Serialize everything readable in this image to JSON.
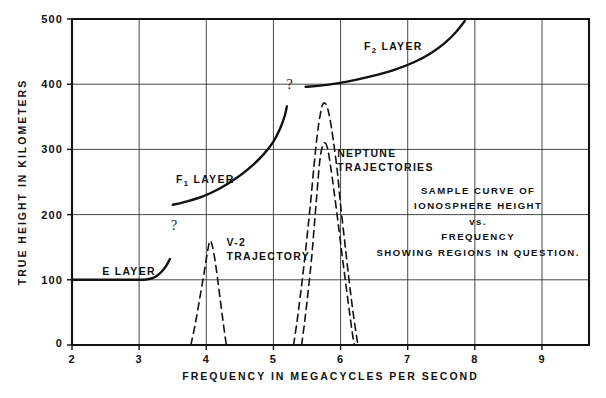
{
  "chart_data": {
    "type": "line",
    "title": "",
    "xlabel": "FREQUENCY IN MEGACYCLES PER SECOND",
    "ylabel": "TRUE HEIGHT IN KILOMETERS",
    "xlim": [
      2,
      9.7
    ],
    "ylim": [
      0,
      500
    ],
    "xticks": [
      2,
      3,
      4,
      5,
      6,
      7,
      8,
      9
    ],
    "xtick_labels": [
      "2",
      "3",
      "4",
      "5",
      "6",
      "7",
      "8",
      "9"
    ],
    "yticks": [
      0,
      100,
      200,
      300,
      400,
      500
    ],
    "ytick_labels": [
      "0",
      "100",
      "200",
      "300",
      "400",
      "500"
    ],
    "grid": true,
    "legend_position": "inline-annotations",
    "series": [
      {
        "name": "E LAYER",
        "style": "solid",
        "label": "E LAYER",
        "label_x": 2.45,
        "label_y": 108,
        "points": [
          [
            2.02,
            100
          ],
          [
            2.4,
            100
          ],
          [
            2.8,
            100
          ],
          [
            3.0,
            100
          ],
          [
            3.1,
            100.5
          ],
          [
            3.18,
            102
          ],
          [
            3.26,
            106
          ],
          [
            3.33,
            112
          ],
          [
            3.4,
            121
          ],
          [
            3.46,
            132
          ]
        ]
      },
      {
        "name": "F1 LAYER",
        "style": "solid",
        "label": "F",
        "label_sub": "1",
        "label_suffix": " LAYER",
        "label_x": 3.55,
        "label_y": 248,
        "points": [
          [
            3.5,
            215
          ],
          [
            3.7,
            220
          ],
          [
            3.95,
            228
          ],
          [
            4.2,
            240
          ],
          [
            4.45,
            256
          ],
          [
            4.65,
            272
          ],
          [
            4.85,
            292
          ],
          [
            5.0,
            312
          ],
          [
            5.1,
            332
          ],
          [
            5.17,
            352
          ],
          [
            5.2,
            366
          ]
        ]
      },
      {
        "name": "F2 LAYER",
        "style": "solid",
        "label": "F",
        "label_sub": "2",
        "label_suffix": " LAYER",
        "label_x": 6.35,
        "label_y": 452,
        "points": [
          [
            5.48,
            396
          ],
          [
            5.8,
            399
          ],
          [
            6.1,
            404
          ],
          [
            6.45,
            412
          ],
          [
            6.8,
            422
          ],
          [
            7.1,
            434
          ],
          [
            7.35,
            448
          ],
          [
            7.55,
            463
          ],
          [
            7.72,
            480
          ],
          [
            7.85,
            497
          ]
        ]
      },
      {
        "name": "V-2 TRAJECTORY",
        "style": "dashed",
        "label": "V-2",
        "label_line2": "TRAJECTORY",
        "label_x": 4.3,
        "label_y": 152,
        "points": [
          [
            3.77,
            0
          ],
          [
            3.82,
            24
          ],
          [
            3.87,
            52
          ],
          [
            3.92,
            82
          ],
          [
            3.97,
            112
          ],
          [
            4.01,
            138
          ],
          [
            4.04,
            155
          ],
          [
            4.06,
            160
          ],
          [
            4.09,
            152
          ],
          [
            4.13,
            130
          ],
          [
            4.17,
            100
          ],
          [
            4.21,
            68
          ],
          [
            4.25,
            36
          ],
          [
            4.29,
            6
          ],
          [
            4.3,
            0
          ]
        ]
      },
      {
        "name": "NEPTUNE TRAJECTORY A",
        "style": "dashed",
        "label": "NEPTUNE",
        "label_line2": "TRAJECTORIES",
        "label_x": 5.95,
        "label_y": 288,
        "points": [
          [
            5.3,
            0
          ],
          [
            5.35,
            35
          ],
          [
            5.4,
            75
          ],
          [
            5.45,
            118
          ],
          [
            5.5,
            165
          ],
          [
            5.55,
            215
          ],
          [
            5.6,
            270
          ],
          [
            5.65,
            320
          ],
          [
            5.7,
            355
          ],
          [
            5.74,
            370
          ],
          [
            5.79,
            368
          ],
          [
            5.84,
            348
          ],
          [
            5.89,
            315
          ],
          [
            5.95,
            268
          ],
          [
            6.0,
            215
          ],
          [
            6.06,
            160
          ],
          [
            6.12,
            105
          ],
          [
            6.18,
            55
          ],
          [
            6.24,
            12
          ],
          [
            6.26,
            0
          ]
        ]
      },
      {
        "name": "NEPTUNE TRAJECTORY B",
        "style": "dashed",
        "points": [
          [
            5.42,
            0
          ],
          [
            5.47,
            40
          ],
          [
            5.52,
            85
          ],
          [
            5.57,
            135
          ],
          [
            5.61,
            185
          ],
          [
            5.65,
            235
          ],
          [
            5.69,
            282
          ],
          [
            5.73,
            305
          ],
          [
            5.77,
            310
          ],
          [
            5.81,
            300
          ],
          [
            5.85,
            275
          ],
          [
            5.9,
            238
          ],
          [
            5.96,
            190
          ],
          [
            6.02,
            140
          ],
          [
            6.08,
            92
          ],
          [
            6.14,
            45
          ],
          [
            6.19,
            8
          ],
          [
            6.21,
            0
          ]
        ]
      }
    ],
    "annotations": [
      {
        "text": "?",
        "x": 3.52,
        "y": 176,
        "name": "question-mark-f1-lower"
      },
      {
        "text": "?",
        "x": 5.24,
        "y": 392,
        "name": "question-mark-f1-upper"
      }
    ],
    "caption": {
      "lines": [
        "SAMPLE CURVE OF",
        "IONOSPHERE HEIGHT",
        "vs.",
        "FREQUENCY",
        "SHOWING  REGIONS IN QUESTION."
      ]
    }
  }
}
